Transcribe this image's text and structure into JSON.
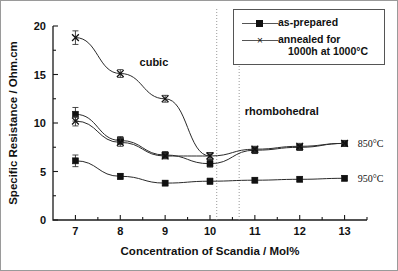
{
  "chart_data": {
    "type": "line",
    "title": "",
    "xlabel": "Concentration of Scandia / Mol%",
    "ylabel": "Specific Resistance / Ohm.cm",
    "xlim": [
      6.5,
      13.5
    ],
    "ylim": [
      0,
      20
    ],
    "xticks": [
      7,
      8,
      9,
      10,
      11,
      12,
      13
    ],
    "yticks": [
      0,
      5,
      10,
      15,
      20
    ],
    "grid": false,
    "legend_position": "top-right",
    "x": [
      7,
      8,
      9,
      10,
      11,
      12,
      13
    ],
    "series": [
      {
        "name": "as-prepared 850°C",
        "marker": "square",
        "values": [
          10.9,
          8.2,
          6.7,
          5.8,
          7.2,
          7.5,
          7.9
        ],
        "errors": [
          0.7,
          0.4,
          0.35,
          0.35,
          0.35,
          0.3,
          0.3
        ]
      },
      {
        "name": "annealed 850°C",
        "marker": "x",
        "values": [
          10.2,
          8.0,
          6.6,
          6.6,
          7.3,
          7.6,
          7.9
        ],
        "errors": [
          0.5,
          0.4,
          0.3,
          0.35,
          0.3,
          0.3,
          0.3
        ]
      },
      {
        "name": "as-prepared 950°C",
        "marker": "square",
        "values": [
          6.1,
          4.5,
          3.8,
          4.0,
          4.1,
          4.2,
          4.3
        ],
        "errors": [
          0.6,
          0.3,
          0.25,
          0.3,
          0.25,
          0.25,
          0.25
        ]
      },
      {
        "name": "annealed cubic",
        "marker": "x",
        "values": [
          18.8,
          15.1,
          12.5,
          6.6,
          null,
          null,
          null
        ],
        "errors": [
          0.7,
          0.4,
          0.35,
          0.35,
          null,
          null,
          null
        ]
      }
    ],
    "phase_boundaries": [
      10.15,
      10.65
    ],
    "annotations": [
      {
        "text": "cubic",
        "x": 8.75,
        "y": 16.3
      },
      {
        "text": "rhombohedral",
        "x": 11.6,
        "y": 11.2
      },
      {
        "text": "850°C",
        "x": 13.25,
        "y": 7.9
      },
      {
        "text": "950°C",
        "x": 13.25,
        "y": 4.3
      }
    ]
  },
  "legend": {
    "items": [
      {
        "label": "as-prepared",
        "marker": "square"
      },
      {
        "label": "annealed for",
        "label_line2": "1000h at 1000°C",
        "marker": "x"
      }
    ]
  },
  "axis": {
    "x_title": "Concentration of Scandia / Mol%",
    "y_title": "Specific Resistance / Ohm.cm",
    "x_tick_labels": [
      "7",
      "8",
      "9",
      "10",
      "11",
      "12",
      "13"
    ],
    "y_tick_labels": [
      "0",
      "5",
      "10",
      "15",
      "20"
    ]
  },
  "labels": {
    "cubic": "cubic",
    "rhombohedral": "rhombohedral",
    "t850": "850°C",
    "t950": "950°C"
  },
  "colors": {
    "marker": "#111111",
    "line": "#2a2a2a",
    "axis": "#1a1a1a",
    "divider": "#8c8c8c",
    "background": "#ffffff"
  }
}
